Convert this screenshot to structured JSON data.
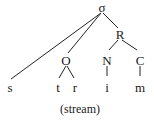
{
  "diagram": {
    "type": "syllable-tree",
    "caption": "(stream)",
    "nodes": {
      "syllable": "σ",
      "rhyme": "R",
      "onset": "O",
      "nucleus": "N",
      "coda": "C"
    },
    "segments": [
      "s",
      "t",
      "r",
      "i",
      "m"
    ],
    "edges": [
      [
        "σ",
        "s"
      ],
      [
        "σ",
        "O"
      ],
      [
        "σ",
        "R"
      ],
      [
        "O",
        "t"
      ],
      [
        "O",
        "r"
      ],
      [
        "R",
        "N"
      ],
      [
        "R",
        "C"
      ],
      [
        "N",
        "i"
      ],
      [
        "C",
        "m"
      ]
    ]
  }
}
